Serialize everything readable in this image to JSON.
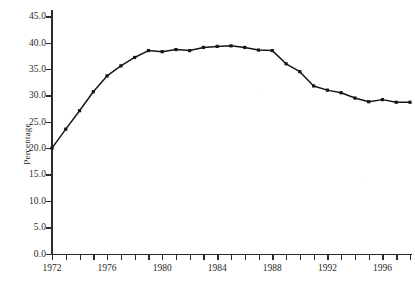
{
  "chart_data": {
    "type": "line",
    "title": "",
    "subtitle": "",
    "xlabel": "",
    "ylabel": "Percentage",
    "xlim": [
      1972,
      1998
    ],
    "ylim": [
      0.0,
      45.0
    ],
    "grid": false,
    "legend": "none",
    "marker": "square",
    "line_color": "#161616",
    "x": [
      1972,
      1973,
      1974,
      1975,
      1976,
      1977,
      1978,
      1979,
      1980,
      1981,
      1982,
      1983,
      1984,
      1985,
      1986,
      1987,
      1988,
      1989,
      1990,
      1991,
      1992,
      1993,
      1994,
      1995,
      1996,
      1997,
      1998
    ],
    "values": [
      20.0,
      23.6,
      27.1,
      30.7,
      33.7,
      35.6,
      37.2,
      38.5,
      38.3,
      38.7,
      38.5,
      39.1,
      39.3,
      39.4,
      39.1,
      38.6,
      38.5,
      36.0,
      34.5,
      31.8,
      31.0,
      30.5,
      29.5,
      28.8,
      29.2,
      28.7,
      28.7
    ],
    "yticks": [
      0.0,
      5.0,
      10.0,
      15.0,
      20.0,
      25.0,
      30.0,
      35.0,
      40.0,
      45.0
    ],
    "ytick_labels": [
      "0.0",
      "5.0",
      "10.0",
      "15.0",
      "20.0",
      "25.0",
      "30.0",
      "35.0",
      "40.0",
      "45.0"
    ],
    "xticks": [
      1972,
      1973,
      1974,
      1975,
      1976,
      1977,
      1978,
      1979,
      1980,
      1981,
      1982,
      1983,
      1984,
      1985,
      1986,
      1987,
      1988,
      1989,
      1990,
      1991,
      1992,
      1993,
      1994,
      1995,
      1996,
      1997,
      1998
    ],
    "xtick_labels_shown": [
      "1972",
      "1976",
      "1980",
      "1984",
      "1988",
      "1992",
      "1996"
    ],
    "xtick_label_years": [
      1972,
      1976,
      1980,
      1984,
      1988,
      1992,
      1996
    ]
  },
  "caption": {
    "text": ""
  }
}
